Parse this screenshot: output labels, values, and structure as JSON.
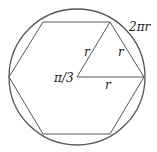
{
  "diagram": {
    "labels": {
      "circumference": "2πr",
      "angle": "π/3",
      "side_left": "r",
      "side_right": "r",
      "side_bottom": "r"
    },
    "colors": {
      "stroke": "#555555",
      "text": "#222222",
      "background": "#ffffff"
    },
    "geometry": {
      "circle": {
        "cx": 77,
        "cy": 77,
        "r": 68
      },
      "hexagon_vertices": [
        [
          9,
          77
        ],
        [
          43,
          22
        ],
        [
          110,
          22
        ],
        [
          144,
          77
        ],
        [
          110,
          134
        ],
        [
          43,
          134
        ]
      ],
      "triangle_vertices": [
        [
          77,
          77
        ],
        [
          110,
          22
        ],
        [
          144,
          77
        ]
      ]
    }
  }
}
